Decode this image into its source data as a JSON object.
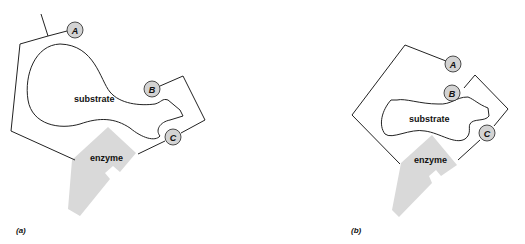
{
  "diagram": {
    "colors": {
      "outline": "#222222",
      "enzyme_fill": "#d9d9d9",
      "site_fill": "#d3d3d3",
      "background": "#ffffff"
    },
    "panels": [
      {
        "id": "a",
        "panel_label": "(a)",
        "substrate_label": "substrate",
        "enzyme_label": "enzyme",
        "sites": [
          {
            "label": "A"
          },
          {
            "label": "B"
          },
          {
            "label": "C"
          }
        ]
      },
      {
        "id": "b",
        "panel_label": "(b)",
        "substrate_label": "substrate",
        "enzyme_label": "enzyme",
        "sites": [
          {
            "label": "A"
          },
          {
            "label": "B"
          },
          {
            "label": "C"
          }
        ]
      }
    ]
  }
}
